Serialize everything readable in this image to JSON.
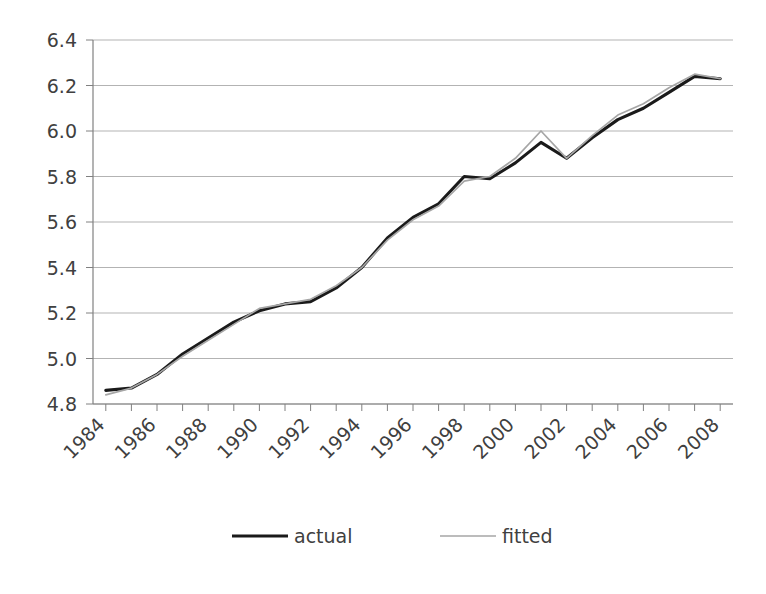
{
  "chart_data": {
    "type": "line",
    "title": "",
    "xlabel": "",
    "ylabel": "",
    "xlim": [
      1983.5,
      2008.5
    ],
    "ylim": [
      4.8,
      6.4
    ],
    "grid": true,
    "legend_position": "bottom",
    "y_ticks": [
      "6.4",
      "6.2",
      "6.0",
      "5.8",
      "5.6",
      "5.4",
      "5.2",
      "5.0",
      "4.8"
    ],
    "y_tick_values": [
      6.4,
      6.2,
      6.0,
      5.8,
      5.6,
      5.4,
      5.2,
      5.0,
      4.8
    ],
    "x_tick_labels": [
      "1984",
      "1986",
      "1988",
      "1990",
      "1992",
      "1994",
      "1996",
      "1998",
      "2000",
      "2002",
      "2004",
      "2006",
      "2008"
    ],
    "x": [
      1984,
      1985,
      1986,
      1987,
      1988,
      1989,
      1990,
      1991,
      1992,
      1993,
      1994,
      1995,
      1996,
      1997,
      1998,
      1999,
      2000,
      2001,
      2002,
      2003,
      2004,
      2005,
      2006,
      2007,
      2008
    ],
    "series": [
      {
        "name": "actual",
        "color": "#1a1a1a",
        "width": 3.1,
        "values": [
          4.86,
          4.87,
          4.93,
          5.02,
          5.09,
          5.16,
          5.21,
          5.24,
          5.25,
          5.31,
          5.4,
          5.53,
          5.62,
          5.68,
          5.8,
          5.79,
          5.86,
          5.95,
          5.88,
          5.97,
          6.05,
          6.1,
          6.17,
          6.24,
          6.23
        ]
      },
      {
        "name": "fitted",
        "color": "#a6a6a6",
        "width": 1.7,
        "values": [
          4.84,
          4.87,
          4.93,
          5.01,
          5.08,
          5.15,
          5.22,
          5.24,
          5.26,
          5.32,
          5.4,
          5.52,
          5.61,
          5.67,
          5.78,
          5.8,
          5.88,
          6.0,
          5.88,
          5.98,
          6.07,
          6.12,
          6.19,
          6.25,
          6.23
        ]
      }
    ]
  },
  "legend": {
    "items": [
      {
        "label": "actual",
        "color": "#1a1a1a"
      },
      {
        "label": "fitted",
        "color": "#a6a6a6"
      }
    ]
  },
  "footer": {
    "caption": ""
  }
}
